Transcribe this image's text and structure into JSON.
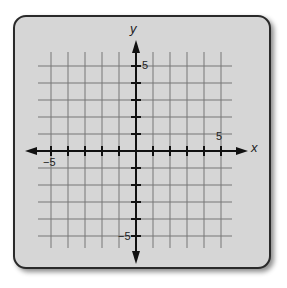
{
  "diagram": {
    "type": "coordinate-plane",
    "x_axis_label": "x",
    "y_axis_label": "y",
    "x_range": [
      -5,
      5
    ],
    "y_range": [
      -5,
      5
    ],
    "grid_step": 1,
    "tick_labels": {
      "x_pos": "5",
      "x_neg": "−5",
      "y_pos": "5",
      "y_neg": "−5"
    },
    "colors": {
      "card_background": "#d6d6d6",
      "card_border": "#2a2a2a",
      "grid_line": "#777777",
      "axis": "#111111"
    }
  }
}
